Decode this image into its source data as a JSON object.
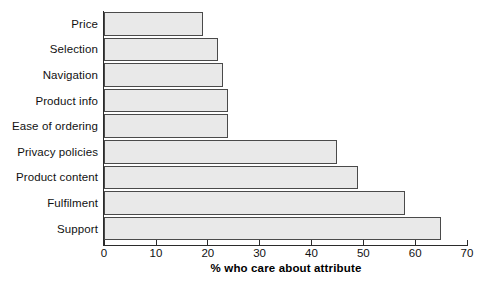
{
  "chart_data": {
    "type": "bar",
    "orientation": "horizontal",
    "title": "",
    "subtitle": "",
    "xlabel": "% who care about attribute",
    "ylabel": "",
    "xlim": [
      0,
      70
    ],
    "xticks": [
      0,
      10,
      20,
      30,
      40,
      50,
      60,
      70
    ],
    "xtick_labels": [
      "0",
      "10",
      "20",
      "30",
      "40",
      "50",
      "60",
      "70"
    ],
    "grid": false,
    "legend": false,
    "legend_position": "none",
    "categories": [
      "Price",
      "Selection",
      "Navigation",
      "Product info",
      "Ease of ordering",
      "Privacy policies",
      "Product content",
      "Fulfilment",
      "Support"
    ],
    "values": [
      19,
      22,
      23,
      24,
      24,
      45,
      49,
      58,
      65
    ],
    "bar_fill_color": "#e9e9e9",
    "bar_border_color": "#4a4a4a",
    "axis_color": "#2b2b2b",
    "background_color": "#ffffff"
  }
}
